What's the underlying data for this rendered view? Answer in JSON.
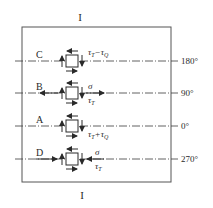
{
  "section_labels": {
    "top": "I",
    "bottom": "I"
  },
  "rows": [
    {
      "point": "C",
      "angle": "180°",
      "stress_main": "τ",
      "stress_main_sub": "T",
      "op": "−",
      "stress_second": "τ",
      "stress_second_sub": "Q",
      "normal": "",
      "axial_arrow": "none"
    },
    {
      "point": "B",
      "angle": "90°",
      "normal": "σ",
      "shear": "τ",
      "shear_sub": "T",
      "axial_arrow": "tension"
    },
    {
      "point": "A",
      "angle": "0°",
      "stress_main": "τ",
      "stress_main_sub": "T",
      "op": "+",
      "stress_second": "τ",
      "stress_second_sub": "Q",
      "normal": "",
      "axial_arrow": "none"
    },
    {
      "point": "D",
      "angle": "270°",
      "normal": "σ",
      "shear": "τ",
      "shear_sub": "T",
      "axial_arrow": "compression"
    }
  ],
  "colors": {
    "line": "#3a3a3a",
    "frame": "#555555",
    "background": "#ffffff"
  }
}
